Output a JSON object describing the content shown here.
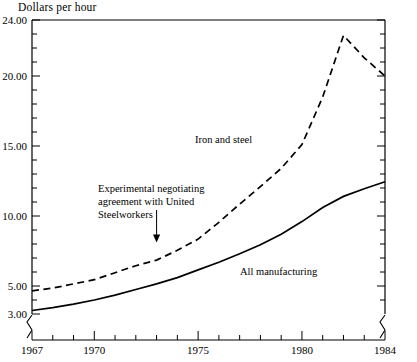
{
  "chart_data": {
    "type": "line",
    "title": "Dollars per hour",
    "xlabel": "",
    "ylabel": "Dollars per hour",
    "xlim": [
      1967,
      1984
    ],
    "ylim": [
      3.0,
      24.0
    ],
    "y_axis_break": true,
    "x_axis_break": true,
    "grid": false,
    "legend_position": "inline-annotations",
    "y_ticks_labeled": [
      "3.00",
      "5.00",
      "10.00",
      "15.00",
      "20.00",
      "24.00"
    ],
    "y_tick_values": [
      3.0,
      5.0,
      10.0,
      15.0,
      20.0,
      24.0
    ],
    "y_minor_step": 1.0,
    "x_ticks_labeled": [
      "1967",
      "1970",
      "1975",
      "1980",
      "1984"
    ],
    "x_tick_values": [
      1967,
      1970,
      1975,
      1980,
      1984
    ],
    "x_minor_step": 1,
    "x": [
      1967,
      1968,
      1969,
      1970,
      1971,
      1972,
      1973,
      1974,
      1975,
      1976,
      1977,
      1978,
      1979,
      1980,
      1981,
      1982,
      1983,
      1984
    ],
    "series": [
      {
        "name": "Iron and steel",
        "style": "dashed",
        "color": "#000000",
        "values": [
          4.65,
          4.85,
          5.15,
          5.45,
          5.95,
          6.45,
          6.85,
          7.55,
          8.35,
          9.55,
          10.85,
          12.1,
          13.4,
          15.1,
          18.5,
          22.9,
          21.3,
          20.0
        ]
      },
      {
        "name": "All manufacturing",
        "style": "solid",
        "color": "#000000",
        "values": [
          3.25,
          3.45,
          3.7,
          4.0,
          4.35,
          4.75,
          5.15,
          5.6,
          6.15,
          6.7,
          7.3,
          7.95,
          8.7,
          9.6,
          10.6,
          11.4,
          11.95,
          12.45
        ]
      }
    ],
    "annotations": [
      {
        "name": "experimental-negotiating-agreement",
        "lines": [
          "Experimental negotiating",
          "agreement with United",
          "Steelworkers"
        ],
        "arrow": true,
        "points_at_x": 1973,
        "points_at_y": 7.6
      },
      {
        "name": "iron-and-steel-label",
        "text": "Iron and steel"
      },
      {
        "name": "all-manufacturing-label",
        "text": "All manufacturing"
      }
    ]
  }
}
